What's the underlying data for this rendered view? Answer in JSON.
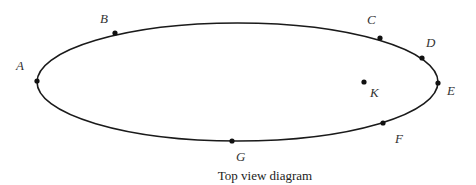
{
  "diagram": {
    "caption": "Top view diagram",
    "ellipse": {
      "cx": 237.5,
      "cy": 82,
      "rx": 200.5,
      "ry": 59,
      "stroke": "#1a1a1a"
    },
    "points": [
      {
        "id": "A",
        "label": "A",
        "x": 37,
        "y": 81,
        "lx": 16,
        "ly": 70
      },
      {
        "id": "B",
        "label": "B",
        "x": 115,
        "y": 33,
        "lx": 100,
        "ly": 23
      },
      {
        "id": "C",
        "label": "C",
        "x": 380,
        "y": 38,
        "lx": 367,
        "ly": 24
      },
      {
        "id": "D",
        "label": "D",
        "x": 422,
        "y": 58,
        "lx": 426,
        "ly": 47
      },
      {
        "id": "E",
        "label": "E",
        "x": 438,
        "y": 83,
        "lx": 447,
        "ly": 95
      },
      {
        "id": "F",
        "label": "F",
        "x": 383,
        "y": 123,
        "lx": 395,
        "ly": 143
      },
      {
        "id": "G",
        "label": "G",
        "x": 232,
        "y": 141,
        "lx": 236,
        "ly": 161
      },
      {
        "id": "K",
        "label": "K",
        "x": 364,
        "y": 82,
        "lx": 370,
        "ly": 97
      }
    ]
  }
}
